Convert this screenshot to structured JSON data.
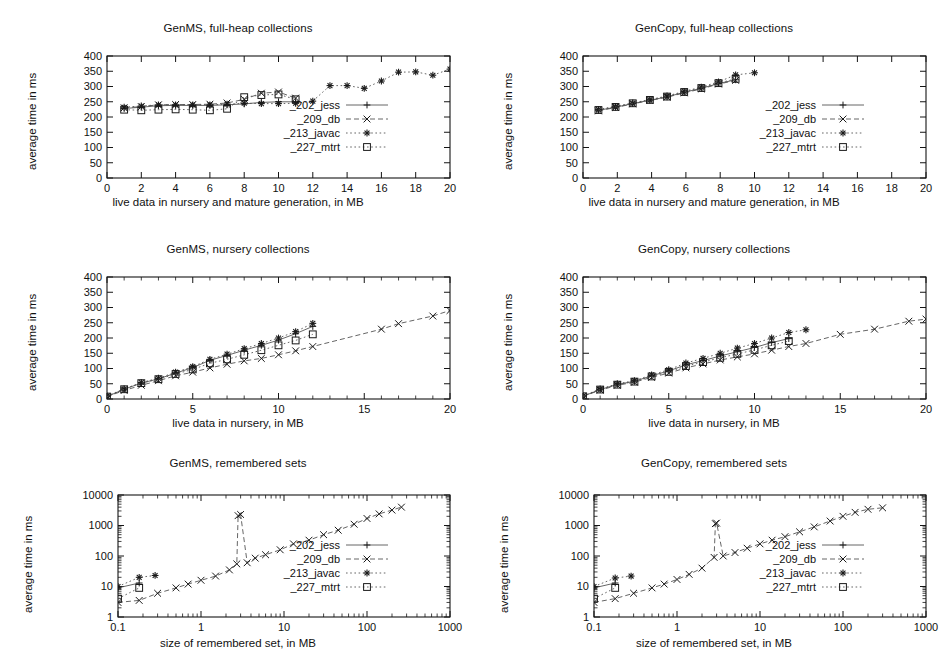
{
  "figure": {
    "series_names": [
      "_202_jess",
      "_209_db",
      "_213_javac",
      "_227_mtrt"
    ],
    "colors": {
      "ink": "#1a1a1a",
      "grid": "#141414",
      "background": "#ffffff"
    }
  },
  "panels": [
    {
      "id": "genms-fullheap",
      "title": "GenMS, full-heap collections",
      "xlabel": "live data in nursery and mature generation, in MB",
      "ylabel": "average time in ms"
    },
    {
      "id": "gencopy-fullheap",
      "title": "GenCopy, full-heap collections",
      "xlabel": "live data in nursery and mature generation, in MB",
      "ylabel": "average time in ms"
    },
    {
      "id": "genms-nursery",
      "title": "GenMS, nursery collections",
      "xlabel": "live data in nursery, in MB",
      "ylabel": "average time in ms"
    },
    {
      "id": "gencopy-nursery",
      "title": "GenCopy, nursery collections",
      "xlabel": "live data in nursery, in MB",
      "ylabel": "average time in ms"
    },
    {
      "id": "genms-remsets",
      "title": "GenMS, remembered sets",
      "xlabel": "size of remembered set, in MB",
      "ylabel": "average time in ms"
    },
    {
      "id": "gencopy-remsets",
      "title": "GenCopy, remembered sets",
      "xlabel": "size of remembered set, in MB",
      "ylabel": "average time in ms"
    }
  ],
  "chart_data": [
    {
      "id": "genms-fullheap",
      "type": "scatter",
      "title": "GenMS, full-heap collections",
      "xlabel": "live data in nursery and mature generation, in MB",
      "ylabel": "average time in ms",
      "xscale": "linear",
      "yscale": "linear",
      "xlim": [
        0,
        20
      ],
      "ylim": [
        0,
        400
      ],
      "xticks": [
        0,
        2,
        4,
        6,
        8,
        10,
        12,
        14,
        16,
        18,
        20
      ],
      "yticks": [
        0,
        50,
        100,
        150,
        200,
        250,
        300,
        350,
        400
      ],
      "grid": false,
      "legend_position": "center-right",
      "series": [
        {
          "name": "_202_jess",
          "marker": "plus",
          "dash": "solid",
          "x": [
            1,
            2,
            3,
            4,
            5,
            6,
            7,
            8,
            9,
            10,
            11
          ],
          "y": [
            228,
            232,
            237,
            238,
            238,
            238,
            240,
            243,
            248,
            250,
            250
          ]
        },
        {
          "name": "_209_db",
          "marker": "cross",
          "dash": "dashed",
          "x": [
            1,
            2,
            3,
            4,
            5,
            6,
            7,
            8,
            9,
            10,
            11
          ],
          "y": [
            230,
            234,
            240,
            241,
            241,
            242,
            246,
            258,
            278,
            282,
            262
          ]
        },
        {
          "name": "_213_javac",
          "marker": "star",
          "dash": "dotted",
          "x": [
            1,
            2,
            3,
            4,
            5,
            6,
            7,
            8,
            9,
            10,
            11,
            12,
            13,
            14,
            15,
            16,
            17,
            18,
            19,
            20
          ],
          "y": [
            232,
            236,
            240,
            240,
            240,
            240,
            242,
            245,
            244,
            244,
            245,
            252,
            303,
            303,
            294,
            318,
            347,
            348,
            337,
            357
          ]
        },
        {
          "name": "_227_mtrt",
          "marker": "square",
          "dash": "dotted",
          "x": [
            1,
            2,
            3,
            4,
            5,
            6,
            7,
            8,
            9,
            10,
            11
          ],
          "y": [
            224,
            222,
            224,
            225,
            224,
            222,
            227,
            265,
            272,
            274,
            258
          ]
        }
      ]
    },
    {
      "id": "gencopy-fullheap",
      "type": "scatter",
      "title": "GenCopy, full-heap collections",
      "xlabel": "live data in nursery and mature generation, in MB",
      "ylabel": "average time in ms",
      "xscale": "linear",
      "yscale": "linear",
      "xlim": [
        0,
        20
      ],
      "ylim": [
        0,
        400
      ],
      "xticks": [
        0,
        2,
        4,
        6,
        8,
        10,
        12,
        14,
        16,
        18,
        20
      ],
      "yticks": [
        0,
        50,
        100,
        150,
        200,
        250,
        300,
        350,
        400
      ],
      "grid": false,
      "legend_position": "center-right",
      "series": [
        {
          "name": "_202_jess",
          "marker": "plus",
          "dash": "solid",
          "x": [
            0.9,
            1.9,
            2.9,
            3.9,
            4.9,
            5.9,
            6.9,
            7.9,
            8.9
          ],
          "y": [
            222,
            232,
            244,
            255,
            266,
            281,
            294,
            310,
            322
          ]
        },
        {
          "name": "_209_db",
          "marker": "cross",
          "dash": "dashed",
          "x": [
            0.9,
            1.9,
            2.9,
            3.9,
            4.9,
            5.9,
            6.9,
            7.9,
            8.9
          ],
          "y": [
            220,
            231,
            243,
            254,
            265,
            279,
            292,
            308,
            320
          ]
        },
        {
          "name": "_213_javac",
          "marker": "star",
          "dash": "dotted",
          "x": [
            0.9,
            1.9,
            2.9,
            3.9,
            4.9,
            5.9,
            6.9,
            7.9,
            8.9,
            10.0
          ],
          "y": [
            225,
            235,
            246,
            257,
            269,
            284,
            298,
            315,
            338,
            345
          ]
        },
        {
          "name": "_227_mtrt",
          "marker": "square",
          "dash": "dotted",
          "x": [
            0.9,
            1.9,
            2.9,
            3.9,
            4.9,
            5.9,
            6.9,
            7.9,
            8.9
          ],
          "y": [
            223,
            233,
            245,
            256,
            267,
            282,
            295,
            311,
            325
          ]
        }
      ]
    },
    {
      "id": "genms-nursery",
      "type": "scatter",
      "title": "GenMS, nursery collections",
      "xlabel": "live data in nursery, in MB",
      "ylabel": "average time in ms",
      "xscale": "linear",
      "yscale": "linear",
      "xlim": [
        0,
        20
      ],
      "ylim": [
        0,
        400
      ],
      "xticks": [
        0,
        5,
        10,
        15,
        20
      ],
      "yticks": [
        0,
        50,
        100,
        150,
        200,
        250,
        300,
        350,
        400
      ],
      "grid": false,
      "legend_position": "none",
      "series": [
        {
          "name": "_202_jess",
          "marker": "plus",
          "dash": "solid",
          "x": [
            0,
            1,
            2,
            3,
            4,
            5,
            6,
            7,
            8,
            9,
            10,
            11,
            12
          ],
          "y": [
            8,
            32,
            52,
            66,
            85,
            103,
            127,
            143,
            160,
            176,
            193,
            214,
            238
          ]
        },
        {
          "name": "_209_db",
          "marker": "cross",
          "dash": "dashed",
          "x": [
            0,
            1,
            2,
            3,
            4,
            5,
            6,
            7,
            8,
            9,
            10,
            11,
            12,
            16,
            17,
            19,
            20
          ],
          "y": [
            8,
            28,
            45,
            60,
            76,
            88,
            102,
            114,
            125,
            133,
            145,
            158,
            172,
            229,
            247,
            272,
            290
          ]
        },
        {
          "name": "_213_javac",
          "marker": "star",
          "dash": "dotted",
          "x": [
            0,
            1,
            2,
            3,
            4,
            5,
            6,
            7,
            8,
            9,
            10,
            11,
            12
          ],
          "y": [
            10,
            33,
            54,
            68,
            88,
            106,
            130,
            147,
            165,
            182,
            200,
            221,
            248
          ]
        },
        {
          "name": "_227_mtrt",
          "marker": "square",
          "dash": "dotted",
          "x": [
            0,
            1,
            2,
            3,
            4,
            5,
            6,
            7,
            8,
            9,
            10,
            11,
            12
          ],
          "y": [
            8,
            32,
            52,
            65,
            82,
            97,
            117,
            130,
            145,
            160,
            176,
            192,
            212
          ]
        }
      ]
    },
    {
      "id": "gencopy-nursery",
      "type": "scatter",
      "title": "GenCopy, nursery collections",
      "xlabel": "live data in nursery, in MB",
      "ylabel": "average time in ms",
      "xscale": "linear",
      "yscale": "linear",
      "xlim": [
        0,
        20
      ],
      "ylim": [
        0,
        400
      ],
      "xticks": [
        0,
        5,
        10,
        15,
        20
      ],
      "yticks": [
        0,
        50,
        100,
        150,
        200,
        250,
        300,
        350,
        400
      ],
      "grid": false,
      "legend_position": "none",
      "series": [
        {
          "name": "_202_jess",
          "marker": "plus",
          "dash": "solid",
          "x": [
            0,
            1,
            2,
            3,
            4,
            5,
            6,
            7,
            8,
            9,
            10,
            11,
            12
          ],
          "y": [
            9,
            31,
            48,
            58,
            76,
            92,
            112,
            126,
            141,
            155,
            169,
            185,
            198
          ]
        },
        {
          "name": "_209_db",
          "marker": "cross",
          "dash": "dashed",
          "x": [
            0,
            1,
            2,
            3,
            4,
            5,
            6,
            7,
            8,
            9,
            10,
            11,
            12,
            13,
            15,
            17,
            19,
            20
          ],
          "y": [
            9,
            29,
            45,
            55,
            71,
            85,
            102,
            115,
            128,
            138,
            148,
            160,
            172,
            182,
            212,
            229,
            255,
            262
          ]
        },
        {
          "name": "_213_javac",
          "marker": "star",
          "dash": "dotted",
          "x": [
            0,
            1,
            2,
            3,
            4,
            5,
            6,
            7,
            8,
            9,
            10,
            11,
            12,
            13
          ],
          "y": [
            10,
            33,
            50,
            60,
            79,
            96,
            118,
            133,
            150,
            167,
            182,
            200,
            218,
            227
          ]
        },
        {
          "name": "_227_mtrt",
          "marker": "square",
          "dash": "dotted",
          "x": [
            0,
            1,
            2,
            3,
            4,
            5,
            6,
            7,
            8,
            9,
            10,
            11,
            12
          ],
          "y": [
            9,
            31,
            47,
            57,
            74,
            89,
            108,
            121,
            135,
            148,
            161,
            176,
            190
          ]
        }
      ]
    },
    {
      "id": "genms-remsets",
      "type": "scatter",
      "title": "GenMS, remembered sets",
      "xlabel": "size of remembered set, in MB",
      "ylabel": "average time in ms",
      "xscale": "log",
      "yscale": "log",
      "xlim": [
        0.1,
        1000
      ],
      "ylim": [
        1,
        10000
      ],
      "xticks": [
        0.1,
        1,
        10,
        100,
        1000
      ],
      "yticks": [
        1,
        10,
        100,
        1000,
        10000
      ],
      "grid": false,
      "legend_position": "center-right",
      "series": [
        {
          "name": "_202_jess",
          "marker": "plus",
          "dash": "solid",
          "x": [
            0.1,
            0.18
          ],
          "y": [
            9,
            13
          ]
        },
        {
          "name": "_209_db",
          "marker": "cross",
          "dash": "dashed",
          "x": [
            0.1,
            0.18,
            0.3,
            0.5,
            0.7,
            1.0,
            1.5,
            2.2,
            2.7,
            2.8,
            3.0,
            3.6,
            4.5,
            6,
            9,
            13,
            20,
            30,
            45,
            70,
            100,
            140,
            200,
            260
          ],
          "y": [
            3,
            3.5,
            6,
            9,
            12,
            16,
            22,
            35,
            55,
            2100,
            2300,
            60,
            85,
            110,
            160,
            250,
            330,
            500,
            700,
            1100,
            1700,
            2400,
            3200,
            4000
          ]
        },
        {
          "name": "_213_javac",
          "marker": "star",
          "dash": "dotted",
          "x": [
            0.1,
            0.18,
            0.28
          ],
          "y": [
            10,
            20,
            23
          ]
        },
        {
          "name": "_227_mtrt",
          "marker": "square",
          "dash": "dotted",
          "x": [
            0.1,
            0.18
          ],
          "y": [
            4,
            9
          ]
        }
      ]
    },
    {
      "id": "gencopy-remsets",
      "type": "scatter",
      "title": "GenCopy, remembered sets",
      "xlabel": "size of remembered set, in MB",
      "ylabel": "average time in ms",
      "xscale": "log",
      "yscale": "log",
      "xlim": [
        0.1,
        1000
      ],
      "ylim": [
        1,
        10000
      ],
      "xticks": [
        0.1,
        1,
        10,
        100,
        1000
      ],
      "yticks": [
        1,
        10,
        100,
        1000,
        10000
      ],
      "grid": false,
      "legend_position": "center-right",
      "series": [
        {
          "name": "_202_jess",
          "marker": "plus",
          "dash": "solid",
          "x": [
            0.1,
            0.18
          ],
          "y": [
            9,
            13
          ]
        },
        {
          "name": "_209_db",
          "marker": "cross",
          "dash": "dashed",
          "x": [
            0.1,
            0.18,
            0.3,
            0.5,
            0.7,
            1.0,
            1.4,
            2.0,
            2.8,
            2.9,
            3.0,
            3.6,
            5,
            7,
            10,
            14,
            20,
            30,
            45,
            70,
            100,
            140,
            200,
            300
          ],
          "y": [
            3,
            4,
            6,
            9,
            12,
            17,
            25,
            40,
            90,
            1150,
            1200,
            100,
            130,
            180,
            250,
            330,
            430,
            620,
            900,
            1400,
            2000,
            2700,
            3400,
            3800
          ]
        },
        {
          "name": "_213_javac",
          "marker": "star",
          "dash": "dotted",
          "x": [
            0.1,
            0.18,
            0.28
          ],
          "y": [
            10,
            19,
            22
          ]
        },
        {
          "name": "_227_mtrt",
          "marker": "square",
          "dash": "dotted",
          "x": [
            0.1,
            0.18
          ],
          "y": [
            4,
            9
          ]
        }
      ]
    }
  ]
}
